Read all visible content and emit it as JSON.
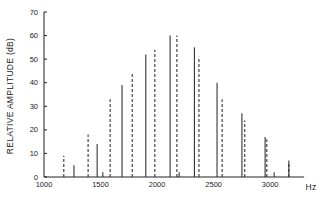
{
  "chart_data": {
    "type": "bar",
    "subtype": "line-spectrum",
    "title": "",
    "xlabel": "Hz",
    "ylabel": "RELATIVE AMPLITUDE (dB)",
    "xlim": [
      1000,
      3300
    ],
    "ylim": [
      0,
      70
    ],
    "x_ticks": [
      1000,
      1500,
      2000,
      2500,
      3000
    ],
    "y_ticks": [
      0,
      10,
      20,
      30,
      40,
      50,
      60,
      70
    ],
    "grid": false,
    "legend": null,
    "series": [
      {
        "name": "solid",
        "style": "solid",
        "points": [
          {
            "x": 1265,
            "y": 5
          },
          {
            "x": 1470,
            "y": 14
          },
          {
            "x": 1520,
            "y": 2
          },
          {
            "x": 1690,
            "y": 39
          },
          {
            "x": 1900,
            "y": 52
          },
          {
            "x": 2115,
            "y": 60
          },
          {
            "x": 2195,
            "y": 2
          },
          {
            "x": 2330,
            "y": 55
          },
          {
            "x": 2530,
            "y": 40
          },
          {
            "x": 2750,
            "y": 27
          },
          {
            "x": 2955,
            "y": 17
          },
          {
            "x": 3035,
            "y": 2
          },
          {
            "x": 3165,
            "y": 7
          }
        ]
      },
      {
        "name": "dashed",
        "style": "dashed",
        "points": [
          {
            "x": 1175,
            "y": 9
          },
          {
            "x": 1390,
            "y": 18
          },
          {
            "x": 1585,
            "y": 33
          },
          {
            "x": 1780,
            "y": 44
          },
          {
            "x": 1980,
            "y": 54
          },
          {
            "x": 2175,
            "y": 60
          },
          {
            "x": 2370,
            "y": 51
          },
          {
            "x": 2575,
            "y": 33
          },
          {
            "x": 2775,
            "y": 24
          },
          {
            "x": 2970,
            "y": 16
          },
          {
            "x": 3165,
            "y": 6
          }
        ]
      }
    ]
  }
}
